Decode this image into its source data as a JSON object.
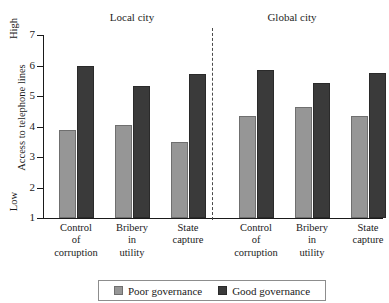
{
  "chart_data": {
    "type": "bar",
    "title": "",
    "xlabel": "",
    "ylabel": "Access to telephone lines",
    "ylim": [
      1,
      7
    ],
    "yticks": [
      1,
      2,
      3,
      4,
      5,
      6,
      7
    ],
    "ytick_labels": [
      "1",
      "2",
      "3",
      "4",
      "5",
      "6",
      "7"
    ],
    "axis_anchor_high": "High",
    "axis_anchor_low": "Low",
    "grid": false,
    "legend_position": "bottom",
    "panels": [
      {
        "name": "Local city",
        "label": "Local city"
      },
      {
        "name": "Global city",
        "label": "Global city"
      }
    ],
    "divider": "dashed vertical line between panels",
    "categories": [
      "Control of corruption",
      "Bribery in utility",
      "State capture",
      "Control of corruption",
      "Bribery in utility",
      "State capture"
    ],
    "category_lines": [
      [
        "Control",
        "of",
        "corruption"
      ],
      [
        "Bribery",
        "in",
        "utility"
      ],
      [
        "State",
        "capture"
      ],
      [
        "Control",
        "of",
        "corruption"
      ],
      [
        "Bribery",
        "in",
        "utility"
      ],
      [
        "State",
        "capture"
      ]
    ],
    "series": [
      {
        "name": "Poor governance",
        "color": "#969696",
        "values": [
          3.9,
          4.05,
          3.48,
          4.36,
          4.63,
          4.33
        ]
      },
      {
        "name": "Good governance",
        "color": "#3a3a3a",
        "values": [
          6.0,
          5.32,
          5.72,
          5.84,
          5.44,
          5.77
        ]
      }
    ]
  },
  "legend": {
    "entries": [
      {
        "label": "Poor governance",
        "swatch": "poor-governance-swatch"
      },
      {
        "label": "Good governance",
        "swatch": "good-governance-swatch"
      }
    ]
  },
  "colors": {
    "poor_governance": "#969696",
    "good_governance": "#3a3a3a",
    "axis": "#1a1a1a",
    "background": "#ffffff"
  }
}
